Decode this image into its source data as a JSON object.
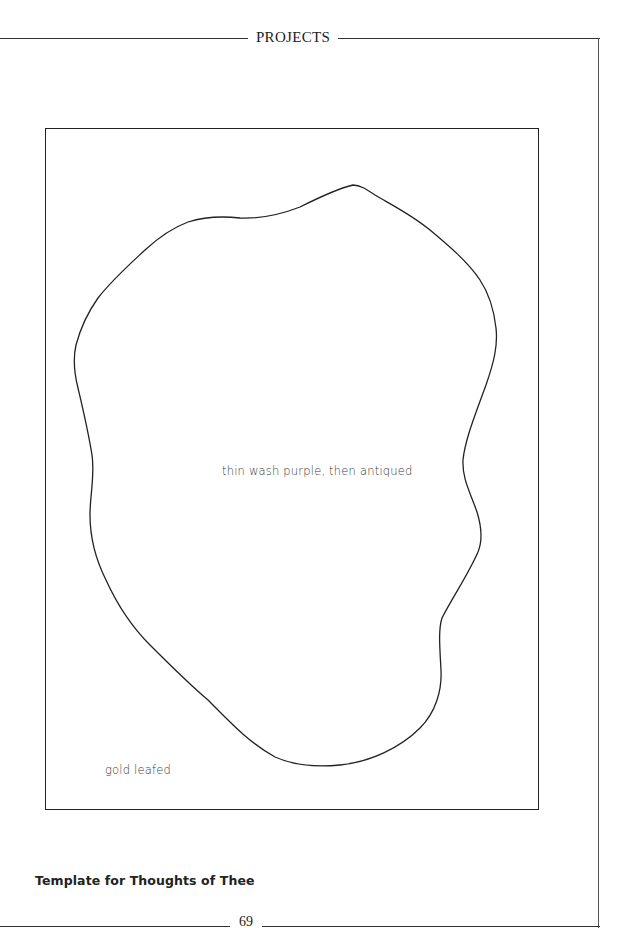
{
  "page": {
    "running_head": "PROJECTS",
    "folio": "69"
  },
  "template": {
    "interior_note": "thin wash purple, then antiqued",
    "border_note": "gold leafed",
    "caption": "Template for Thoughts of Thee"
  },
  "colors": {
    "ink": "#222222",
    "paper": "#ffffff"
  }
}
